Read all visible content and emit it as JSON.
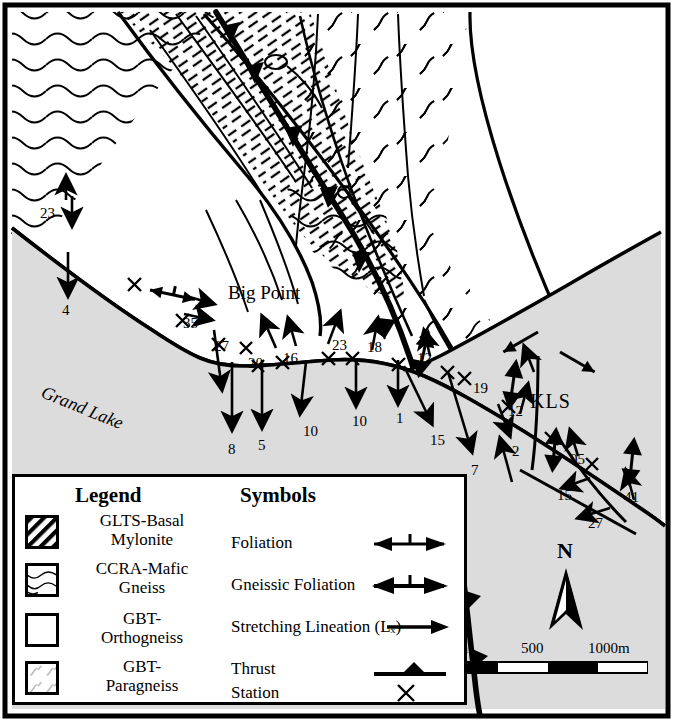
{
  "map": {
    "title_features": {
      "place_label": "Big Point",
      "lake_label": "Grand Lake",
      "unit_label_kls": "KLS"
    },
    "north_arrow_label": "N",
    "scale_bar": {
      "ticks": [
        "0m",
        "500",
        "1000m"
      ],
      "max_meters": 1000
    },
    "background_color": "#ffffff",
    "lake_color": "#dcdcdc",
    "line_color": "#000000",
    "station_marker": "x-cross",
    "measurements": [
      {
        "value": "23",
        "x": 40,
        "y": 205
      },
      {
        "value": "4",
        "x": 62,
        "y": 302
      },
      {
        "value": "35",
        "x": 183,
        "y": 315
      },
      {
        "value": "27",
        "x": 214,
        "y": 338
      },
      {
        "value": "20",
        "x": 248,
        "y": 355
      },
      {
        "value": "16",
        "x": 283,
        "y": 350
      },
      {
        "value": "23",
        "x": 332,
        "y": 337
      },
      {
        "value": "18",
        "x": 367,
        "y": 339
      },
      {
        "value": "12",
        "x": 417,
        "y": 350
      },
      {
        "value": "19",
        "x": 473,
        "y": 380
      },
      {
        "value": "12",
        "x": 508,
        "y": 403
      },
      {
        "value": "8",
        "x": 228,
        "y": 441
      },
      {
        "value": "5",
        "x": 258,
        "y": 437
      },
      {
        "value": "10",
        "x": 303,
        "y": 423
      },
      {
        "value": "10",
        "x": 352,
        "y": 413
      },
      {
        "value": "1",
        "x": 396,
        "y": 410
      },
      {
        "value": "15",
        "x": 430,
        "y": 432
      },
      {
        "value": "7",
        "x": 471,
        "y": 462
      },
      {
        "value": "2",
        "x": 512,
        "y": 443
      },
      {
        "value": "05",
        "x": 570,
        "y": 451
      },
      {
        "value": "15",
        "x": 557,
        "y": 487
      },
      {
        "value": "41",
        "x": 624,
        "y": 489
      },
      {
        "value": "27",
        "x": 588,
        "y": 515
      }
    ]
  },
  "legend": {
    "heading_units": "Legend",
    "heading_symbols": "Symbols",
    "units": [
      {
        "name": "GLTS-Basal\nMylonite",
        "line1": "GLTS-Basal",
        "line2": "Mylonite",
        "pattern": "diagonal-hatch"
      },
      {
        "name": "CCRA-Mafic\nGneiss",
        "line1": "CCRA-Mafic",
        "line2": "Gneiss",
        "pattern": "wavy-lines"
      },
      {
        "name": "GBT-\nOrthogneiss",
        "line1": "GBT-",
        "line2": "Orthogneiss",
        "pattern": "blank"
      },
      {
        "name": "GBT-\nParagneiss",
        "line1": "GBT-",
        "line2": "Paragneiss",
        "pattern": "squiggles"
      }
    ],
    "symbols": [
      {
        "label": "Foliation",
        "glyph": "foliation-arrow"
      },
      {
        "label": "Gneissic Foliation",
        "glyph": "gneissic-foliation-arrow"
      },
      {
        "label": "Stretching Lineation (Lₓ)",
        "glyph": "lineation-arrow"
      },
      {
        "label": "Thrust",
        "glyph": "thrust-line"
      },
      {
        "label": "Station",
        "glyph": "x-cross"
      }
    ]
  }
}
